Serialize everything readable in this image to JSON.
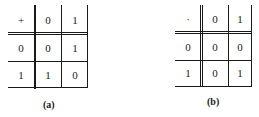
{
  "tables": [
    {
      "operator": "+",
      "header": [
        "0",
        "1"
      ],
      "rows": [
        {
          "label": "0",
          "values": [
            "0",
            "1"
          ]
        },
        {
          "label": "1",
          "values": [
            "1",
            "0"
          ]
        }
      ],
      "caption": "(a)"
    },
    {
      "operator": "·",
      "header": [
        "0",
        "1"
      ],
      "rows": [
        {
          "label": "0",
          "values": [
            "0",
            "0"
          ]
        },
        {
          "label": "1",
          "values": [
            "0",
            "1"
          ]
        }
      ],
      "caption": "(b)"
    }
  ]
}
